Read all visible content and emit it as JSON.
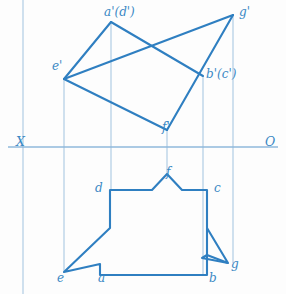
{
  "drawing": {
    "title": "Orthographic projection — two-view descriptive geometry problem",
    "type": "engineering-line-drawing",
    "width": 286,
    "height": 294,
    "colors": {
      "background": "#fdfdfd",
      "object_line": "#2f7fc1",
      "projection_line": "#a9c9e2",
      "axis_line": "#8fb9db",
      "label_text": "#3a88c4"
    },
    "axis": {
      "left_label": "X",
      "right_label": "O",
      "y": 147,
      "x_start": 8,
      "x_end": 278
    },
    "labels": [
      {
        "id": "a-prime-d-prime",
        "text": "a'(d')",
        "x": 104,
        "y": 6,
        "view": "front"
      },
      {
        "id": "g-prime",
        "text": "g'",
        "x": 239,
        "y": 6,
        "view": "front"
      },
      {
        "id": "e-prime",
        "text": "e'",
        "x": 52,
        "y": 60,
        "view": "front"
      },
      {
        "id": "b-prime-c-prime",
        "text": "b'(c')",
        "x": 206,
        "y": 68,
        "view": "front"
      },
      {
        "id": "f-prime",
        "text": "f'",
        "x": 162,
        "y": 121,
        "view": "front"
      },
      {
        "id": "x-axis",
        "text": "X",
        "x": 16,
        "y": 136,
        "view": "axis"
      },
      {
        "id": "o-axis",
        "text": "O",
        "x": 265,
        "y": 136,
        "view": "axis"
      },
      {
        "id": "f",
        "text": "f",
        "x": 166,
        "y": 166,
        "view": "top"
      },
      {
        "id": "d",
        "text": "d",
        "x": 95,
        "y": 182,
        "view": "top"
      },
      {
        "id": "c",
        "text": "c",
        "x": 214,
        "y": 182,
        "view": "top"
      },
      {
        "id": "g",
        "text": "g",
        "x": 231,
        "y": 258,
        "view": "top"
      },
      {
        "id": "e",
        "text": "e",
        "x": 57,
        "y": 272,
        "view": "top"
      },
      {
        "id": "a",
        "text": "a",
        "x": 98,
        "y": 272,
        "view": "top"
      },
      {
        "id": "b",
        "text": "b",
        "x": 209,
        "y": 272,
        "view": "top"
      }
    ],
    "front_view": {
      "name": "front-view-projection",
      "vertices": {
        "a_d": [
          111,
          22
        ],
        "g": [
          233,
          15
        ],
        "e": [
          64,
          79
        ],
        "b_c": [
          203,
          76
        ],
        "f": [
          167,
          130
        ]
      },
      "segments": [
        {
          "id": "seg-ad-to-bc",
          "from": "a_d",
          "to": "b_c"
        },
        {
          "id": "seg-e-to-g",
          "from": "e",
          "to": "g"
        },
        {
          "id": "seg-e-to-f",
          "from": "e",
          "to": "f"
        },
        {
          "id": "seg-f-to-g",
          "from": "f",
          "to": "g"
        },
        {
          "id": "seg-ad-to-e",
          "from": "a_d",
          "to": "e"
        }
      ]
    },
    "top_view": {
      "name": "top-view-projection",
      "outline": [
        [
          110,
          190
        ],
        [
          152,
          190
        ],
        [
          167,
          174
        ],
        [
          182,
          190
        ],
        [
          207,
          190
        ],
        [
          207,
          275
        ],
        [
          100,
          275
        ],
        [
          100,
          264
        ],
        [
          64,
          272
        ],
        [
          110,
          228
        ]
      ],
      "g_triangle": [
        [
          207,
          228
        ],
        [
          228,
          263
        ],
        [
          207,
          255
        ]
      ],
      "g_tail": [
        [
          207,
          255
        ],
        [
          202,
          258
        ],
        [
          228,
          263
        ]
      ]
    },
    "projection_lines": [
      {
        "id": "proj-line-left-border",
        "x": 23,
        "y1": 0,
        "y2": 294
      },
      {
        "id": "proj-line-e",
        "x": 64,
        "y1": 79,
        "y2": 272
      },
      {
        "id": "proj-line-ad",
        "x": 111,
        "y1": 22,
        "y2": 190
      },
      {
        "id": "proj-line-f",
        "x": 167,
        "y1": 130,
        "y2": 174
      },
      {
        "id": "proj-line-bc",
        "x": 203,
        "y1": 76,
        "y2": 275
      },
      {
        "id": "proj-line-g",
        "x": 233,
        "y1": 15,
        "y2": 263
      }
    ]
  }
}
